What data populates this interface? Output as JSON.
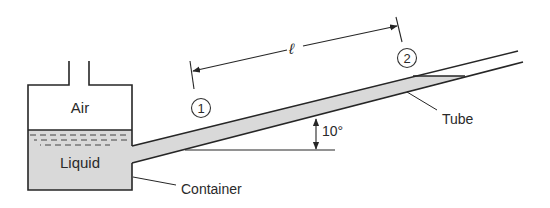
{
  "diagram": {
    "type": "fluid-mechanics schematic",
    "labels": {
      "air": "Air",
      "liquid": "Liquid",
      "container": "Container",
      "tube": "Tube",
      "length": "ℓ",
      "angle": "10°",
      "point1": "1",
      "point2": "2"
    },
    "colors": {
      "line": "#262626",
      "liquid_fill": "#d9d9d9",
      "background": "#ffffff"
    },
    "angle_deg": 10
  }
}
